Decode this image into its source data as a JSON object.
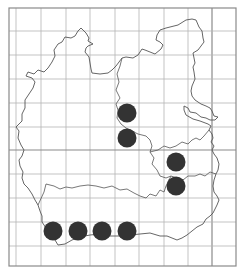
{
  "map": {
    "type": "distribution-grid-map",
    "frame": {
      "x": 9,
      "y": 8,
      "width": 227,
      "height": 258
    },
    "grid_x": [
      16,
      41,
      66,
      90,
      115,
      139,
      164,
      188,
      212
    ],
    "grid_y": [
      31,
      55,
      79,
      103,
      127,
      150,
      174,
      198,
      222,
      246
    ],
    "major_x": [
      212
    ],
    "major_y": [
      150
    ],
    "colors": {
      "grid": "#b4b4b4",
      "major": "#8a8a8a",
      "outline": "#555555",
      "dot": "#333333",
      "frame": "#8a8a8a"
    },
    "dot_radius": 9.5,
    "dots": [
      {
        "x": 127,
        "y": 113
      },
      {
        "x": 127,
        "y": 138
      },
      {
        "x": 176,
        "y": 162
      },
      {
        "x": 176,
        "y": 186
      },
      {
        "x": 53,
        "y": 231
      },
      {
        "x": 78,
        "y": 231
      },
      {
        "x": 102,
        "y": 231
      },
      {
        "x": 127,
        "y": 231
      }
    ]
  }
}
